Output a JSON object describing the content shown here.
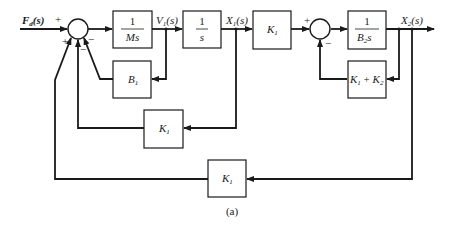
{
  "diagram": {
    "caption": "(a)",
    "signals": {
      "input": "F",
      "input_sub": "d",
      "input_arg": "(s)",
      "v1": "V",
      "v1_sub": "1",
      "v1_arg": "(s)",
      "x1": "X",
      "x1_sub": "1",
      "x1_arg": "(s)",
      "x2": "X",
      "x2_sub": "2",
      "x2_arg": "(s)"
    },
    "blocks": {
      "mass": {
        "num": "1",
        "den": "Ms"
      },
      "integrator": {
        "num": "1",
        "den": "s"
      },
      "b1": {
        "label": "B",
        "sub": "1"
      },
      "k1_forward": {
        "label": "K",
        "sub": "1"
      },
      "k1_middle": {
        "label": "K",
        "sub": "1"
      },
      "k1_outer": {
        "label": "K",
        "sub": "1"
      },
      "b2": {
        "num": "1",
        "den": "B",
        "den_sub": "2",
        "den_tail": "s"
      },
      "k1k2": {
        "a": "K",
        "a_sub": "1",
        "op": " + ",
        "b": "K",
        "b_sub": "2"
      }
    },
    "summing_junctions": {
      "sum1": {
        "top_left": "+",
        "bottom_left": "+",
        "bottom_mid": "−",
        "bottom_right": "−"
      },
      "sum2": {
        "top_left": "+",
        "bottom_right": "−"
      }
    }
  }
}
